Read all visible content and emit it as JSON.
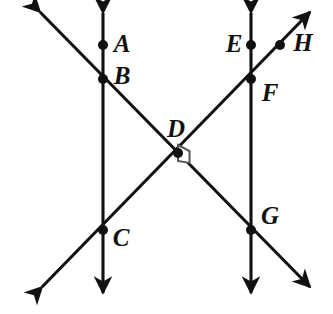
{
  "figure": {
    "background_color": "#ffffff",
    "line_color": "#111111",
    "point_color": "#111111",
    "right_angle_mark_color": "#555555",
    "width": 333,
    "height": 314
  },
  "points": [
    {
      "label": "A",
      "x": 103,
      "y": 45,
      "label_x": 122,
      "label_y": 43
    },
    {
      "label": "B",
      "x": 103,
      "y": 79,
      "label_x": 122,
      "label_y": 75
    },
    {
      "label": "C",
      "x": 103,
      "y": 230,
      "label_x": 121,
      "label_y": 237
    },
    {
      "label": "D",
      "x": 178,
      "y": 153,
      "label_x": 176,
      "label_y": 128
    },
    {
      "label": "E",
      "x": 251,
      "y": 45,
      "label_x": 234,
      "label_y": 43
    },
    {
      "label": "F",
      "x": 251,
      "y": 79,
      "label_x": 270,
      "label_y": 92
    },
    {
      "label": "G",
      "x": 251,
      "y": 230,
      "label_x": 270,
      "label_y": 215
    },
    {
      "label": "H",
      "x": 280,
      "y": 45,
      "label_x": 303,
      "label_y": 42
    }
  ],
  "lines": [
    {
      "name": "vertical-line-left",
      "x1": 103,
      "y1": 13,
      "x2": 103,
      "y2": 293,
      "arrow_start": true,
      "arrow_end": true
    },
    {
      "name": "vertical-line-right",
      "x1": 251,
      "y1": 13,
      "x2": 251,
      "y2": 293,
      "arrow_start": true,
      "arrow_end": true
    },
    {
      "name": "transversal-bdg",
      "x1": 40,
      "y1": 12,
      "x2": 310,
      "y2": 287,
      "arrow_start": true,
      "arrow_end": true
    },
    {
      "name": "transversal-cdh",
      "x1": 42,
      "y1": 287,
      "x2": 310,
      "y2": 12,
      "arrow_start": true,
      "arrow_end": true
    }
  ],
  "right_angle": {
    "name": "right-angle-at-d",
    "vertex_x": 178,
    "vertex_y": 153,
    "size": 16,
    "orientation": "east"
  },
  "chart_data": {
    "type": "diagram",
    "labeled_points": [
      "A",
      "B",
      "C",
      "D",
      "E",
      "F",
      "G",
      "H"
    ],
    "parallel_lines": [
      [
        "A",
        "B",
        "C"
      ],
      [
        "E",
        "F",
        "G"
      ]
    ],
    "transversals": [
      [
        "B",
        "D",
        "G"
      ],
      [
        "C",
        "D",
        "H"
      ]
    ],
    "perpendicular_at": "D"
  }
}
